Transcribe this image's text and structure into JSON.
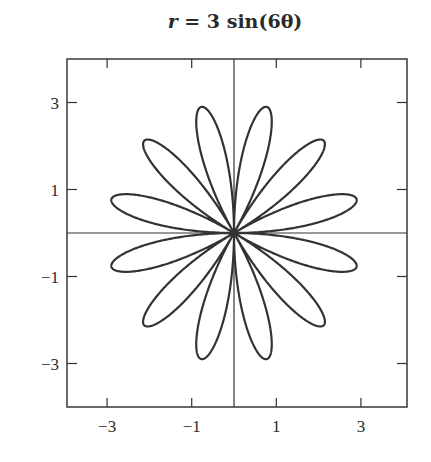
{
  "chart_data": {
    "type": "line",
    "subtype": "polar-rose",
    "title": "r = 3 sin(6θ)",
    "equation": {
      "amplitude": 3,
      "k": 6,
      "function": "sin"
    },
    "petals": 12,
    "petal_length": 3,
    "xlabel": "",
    "ylabel": "",
    "xlim": [
      -4,
      4
    ],
    "ylim": [
      -4,
      4
    ],
    "x_ticks": [
      -3,
      -1,
      1,
      3
    ],
    "y_ticks": [
      3,
      1,
      -1,
      -3
    ],
    "x_tick_labels": [
      "−3",
      "−1",
      "1",
      "3"
    ],
    "y_tick_labels": [
      "3",
      "1",
      "−1",
      "−3"
    ],
    "grid": false,
    "axes_through_origin": true,
    "legend": null,
    "line_color": "#333333"
  },
  "title": {
    "var": "r",
    "eq": " = 3",
    "fn": "sin",
    "arg": "(6θ)"
  }
}
